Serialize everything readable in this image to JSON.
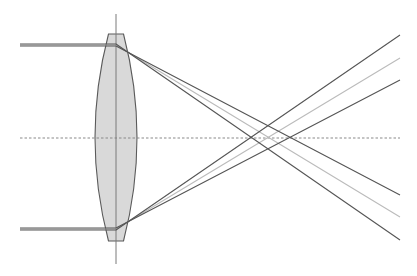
{
  "diagram": {
    "type": "optics-ray-diagram",
    "colors": {
      "background": "#ffffff",
      "lens_fill": "#d9d9d9",
      "lens_stroke": "#5a5a5a",
      "principal_plane": "#7a7a7a",
      "axis": "#8a8a8a",
      "ray_dark": "#555555",
      "ray_light": "#bbbbbb"
    },
    "optical_axis": {
      "y": 138,
      "x1": 20,
      "x2": 400,
      "dashed": true
    },
    "principal_plane": {
      "x": 116,
      "y1": 14,
      "y2": 264
    },
    "lens": {
      "center_x": 116,
      "top_y": 34,
      "bottom_y": 241,
      "flat_half_width": 7.5,
      "mid_half_width": 21
    },
    "rays": [
      {
        "name": "top-outer",
        "color": "ray_dark",
        "incident_y": 44,
        "points": [
          [
            20,
            44
          ],
          [
            116,
            44
          ],
          [
            400,
            240
          ]
        ]
      },
      {
        "name": "top-mid",
        "color": "ray_light",
        "incident_y": 45,
        "points": [
          [
            20,
            45
          ],
          [
            116,
            45
          ],
          [
            400,
            217
          ]
        ]
      },
      {
        "name": "top-inner",
        "color": "ray_dark",
        "incident_y": 46,
        "points": [
          [
            20,
            46
          ],
          [
            116,
            46
          ],
          [
            400,
            195
          ]
        ]
      },
      {
        "name": "bottom-outer",
        "color": "ray_dark",
        "incident_y": 230,
        "points": [
          [
            20,
            230
          ],
          [
            116,
            230
          ],
          [
            400,
            35
          ]
        ]
      },
      {
        "name": "bottom-mid",
        "color": "ray_light",
        "incident_y": 229,
        "points": [
          [
            20,
            229
          ],
          [
            116,
            229
          ],
          [
            400,
            58
          ]
        ]
      },
      {
        "name": "bottom-inner",
        "color": "ray_dark",
        "incident_y": 228,
        "points": [
          [
            20,
            228
          ],
          [
            116,
            228
          ],
          [
            400,
            80
          ]
        ]
      }
    ],
    "focal_crossings_x": [
      248,
      268,
      292
    ]
  }
}
